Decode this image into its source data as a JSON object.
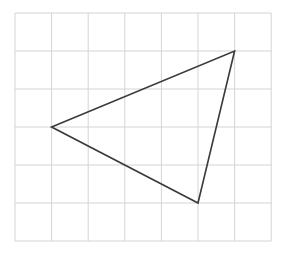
{
  "diagram": {
    "type": "grid-with-triangle",
    "background": "#ffffff",
    "grid": {
      "columns": 7,
      "rows": 6,
      "origin_px": [
        15,
        13
      ],
      "cell_width_px": 36.6,
      "cell_height_px": 38,
      "line_color": "#d4d4d4",
      "line_width": 1
    },
    "triangle": {
      "stroke_color": "#3a3a3a",
      "stroke_width": 1.6,
      "fill": "none",
      "vertices_grid": [
        {
          "name": "left",
          "col": 1,
          "row": 3
        },
        {
          "name": "top-right",
          "col": 6,
          "row": 1
        },
        {
          "name": "bottom",
          "col": 5,
          "row": 5
        }
      ]
    }
  }
}
